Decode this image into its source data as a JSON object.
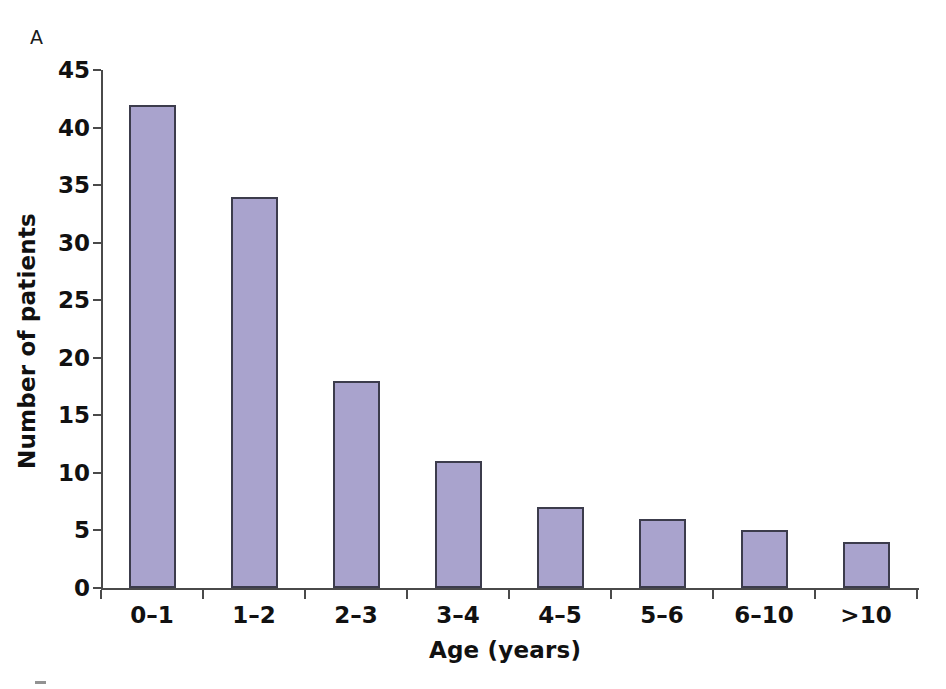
{
  "panel": {
    "label": "A",
    "next_panel_hint": ""
  },
  "chart_data": {
    "type": "bar",
    "title": "",
    "xlabel": "Age (years)",
    "ylabel": "Number of patients",
    "categories": [
      "0–1",
      "1–2",
      "2–3",
      "3–4",
      "4–5",
      "5–6",
      "6–10",
      ">10"
    ],
    "values": [
      42,
      34,
      18,
      11,
      7,
      6,
      5,
      4
    ],
    "ylim": [
      0,
      45
    ],
    "yticks": [
      0,
      5,
      10,
      15,
      20,
      25,
      30,
      35,
      40,
      45
    ],
    "ytick_labels": [
      "0",
      "5",
      "10",
      "15",
      "20",
      "25",
      "30",
      "35",
      "40",
      "45"
    ],
    "grid": false,
    "legend": null,
    "bar_fill_color": "#a9a3cd",
    "bar_border_color": "#3c3c4c",
    "axis_color": "#4a4a4a",
    "text_color": "#111111"
  }
}
